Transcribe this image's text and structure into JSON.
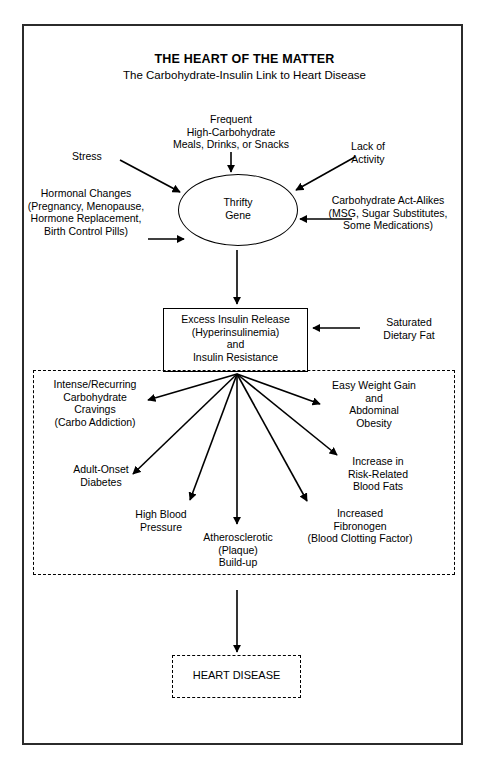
{
  "figure": {
    "title": "THE HEART OF THE MATTER",
    "subtitle": "The Carbohydrate-Insulin Link to Heart Disease"
  },
  "nodes": {
    "thrifty_gene": "Thrifty\nGene",
    "excess_insulin": "Excess Insulin Release\n(Hyperinsulinemia)\nand\nInsulin Resistance",
    "heart_disease": "HEART DISEASE"
  },
  "triggers": [
    {
      "id": "stress",
      "label": "Stress"
    },
    {
      "id": "frequent-high-carbohydrate",
      "label": "Frequent\nHigh-Carbohydrate\nMeals, Drinks, or Snacks"
    },
    {
      "id": "lack-of-activity",
      "label": "Lack of\nActivity"
    },
    {
      "id": "hormonal-changes",
      "label": "Hormonal Changes\n(Pregnancy, Menopause,\nHormone Replacement,\nBirth Control Pills)"
    },
    {
      "id": "carbohydrate-act-alikes",
      "label": "Carbohydrate Act-Alikes\n(MSG, Sugar Substitutes,\nSome Medications)"
    }
  ],
  "cofactors": [
    {
      "id": "saturated-dietary-fat",
      "label": "Saturated\nDietary Fat"
    }
  ],
  "outcomes": [
    {
      "id": "carbohydrate-cravings",
      "label": "Intense/Recurring\nCarbohydrate\nCravings\n(Carbo Addiction)"
    },
    {
      "id": "adult-onset-diabetes",
      "label": "Adult-Onset\nDiabetes"
    },
    {
      "id": "high-blood-pressure",
      "label": "High Blood\nPressure"
    },
    {
      "id": "atherosclerotic-build-up",
      "label": "Atherosclerotic\n(Plaque)\nBuild-up"
    },
    {
      "id": "increased-fibronogen",
      "label": "Increased\nFibronogen\n(Blood Clotting Factor)"
    },
    {
      "id": "risk-related-blood-fats",
      "label": "Increase in\nRisk-Related\nBlood Fats"
    },
    {
      "id": "easy-weight-gain",
      "label": "Easy Weight Gain\nand\nAbdominal\nObesity"
    }
  ],
  "colors": {
    "stroke": "#000000",
    "frame": "#2b2b2b",
    "background": "#ffffff"
  }
}
